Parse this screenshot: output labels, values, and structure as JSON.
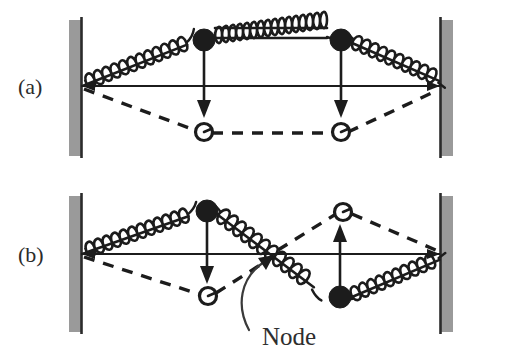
{
  "figure": {
    "background_color": "#ffffff",
    "ink_color": "#1c1c1c",
    "wall_color": "#9a9a9a",
    "width": 513,
    "height": 359
  },
  "panels": [
    {
      "id": "panel-a",
      "label": "(a)",
      "label_x": 18,
      "label_y": 94,
      "mode_name": "symmetric-mode",
      "description": "Both masses displaced downward in phase; no node between them",
      "axis": {
        "y": 86,
        "x_start": 82,
        "x_end": 440
      },
      "wall_left": {
        "x": 69,
        "y": 20,
        "width": 13,
        "height": 136,
        "edge_side": "right"
      },
      "wall_right": {
        "x": 440,
        "y": 20,
        "width": 13,
        "height": 136,
        "edge_side": "left"
      },
      "masses": [
        {
          "name": "mass-1-equilibrium",
          "type": "filled",
          "x": 204,
          "y": 40,
          "r": 11
        },
        {
          "name": "mass-2-equilibrium",
          "type": "filled",
          "x": 341,
          "y": 40,
          "r": 11
        },
        {
          "name": "mass-1-displaced",
          "type": "open",
          "x": 204,
          "y": 132,
          "r": 9
        },
        {
          "name": "mass-2-displaced",
          "type": "open",
          "x": 341,
          "y": 132,
          "r": 9
        }
      ],
      "arrows": [
        {
          "name": "displacement-arrow-mass-1",
          "direction": "down",
          "x": 204,
          "y_from": 40,
          "y_to": 113
        },
        {
          "name": "displacement-arrow-mass-2",
          "direction": "down",
          "x": 341,
          "y_from": 40,
          "y_to": 113
        }
      ],
      "springs": [
        {
          "name": "spring-left",
          "orientation": "diagonal-up",
          "from_x": 82,
          "from_y": 86,
          "to_x": 193,
          "to_y": 42,
          "coils": 14
        },
        {
          "name": "spring-middle",
          "orientation": "horizontal",
          "from_x": 215,
          "from_y": 37,
          "to_x": 330,
          "to_y": 37,
          "coils": 17
        },
        {
          "name": "spring-right",
          "orientation": "diagonal-down",
          "from_x": 352,
          "from_y": 42,
          "to_x": 439,
          "to_y": 86,
          "coils": 14
        }
      ],
      "dashed_outline": "wall-left anchor to mass-1 displaced to mass-2 displaced to wall-right anchor"
    },
    {
      "id": "panel-b",
      "label": "(b)",
      "label_x": 18,
      "label_y": 262,
      "mode_name": "antisymmetric-mode",
      "description": "Masses displaced in opposite directions; a node sits midway on the central spring",
      "axis": {
        "y": 254,
        "x_start": 82,
        "x_end": 440
      },
      "wall_left": {
        "x": 69,
        "y": 196,
        "width": 13,
        "height": 136,
        "edge_side": "right"
      },
      "wall_right": {
        "x": 440,
        "y": 196,
        "width": 13,
        "height": 136,
        "edge_side": "left"
      },
      "masses": [
        {
          "name": "mass-1-equilibrium",
          "type": "filled",
          "x": 207,
          "y": 211,
          "r": 11
        },
        {
          "name": "mass-2-equilibrium",
          "type": "filled",
          "x": 340,
          "y": 297,
          "r": 11
        },
        {
          "name": "mass-1-displaced",
          "type": "open",
          "x": 208,
          "y": 296,
          "r": 9
        },
        {
          "name": "mass-2-displaced",
          "type": "open",
          "x": 343,
          "y": 212,
          "r": 9
        }
      ],
      "arrows": [
        {
          "name": "displacement-arrow-mass-1",
          "direction": "down",
          "x": 207,
          "y_from": 211,
          "y_to": 278
        },
        {
          "name": "displacement-arrow-mass-2",
          "direction": "up",
          "x": 340,
          "y_from": 297,
          "y_to": 229
        }
      ],
      "springs": [
        {
          "name": "spring-left",
          "orientation": "diagonal-up",
          "from_x": 82,
          "from_y": 254,
          "to_x": 196,
          "to_y": 213,
          "coils": 14
        },
        {
          "name": "spring-middle",
          "orientation": "diagonal-down",
          "from_x": 218,
          "from_y": 214,
          "to_x": 329,
          "to_y": 296,
          "coils": 13
        },
        {
          "name": "spring-right",
          "orientation": "diagonal-up",
          "from_x": 351,
          "from_y": 296,
          "to_x": 439,
          "to_y": 254,
          "coils": 13
        }
      ],
      "node": {
        "label": "Node",
        "label_x": 262,
        "label_y": 345,
        "point_x": 272,
        "point_y": 258,
        "callout_from_x": 250,
        "callout_from_y": 330
      },
      "dashed_outline": "wall-left anchor to mass-1 displaced to node to mass-2 displaced to wall-right anchor"
    }
  ]
}
